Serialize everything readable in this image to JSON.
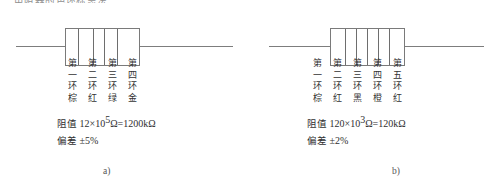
{
  "top_cut_text": "电阻器的色环标志法",
  "figures": [
    {
      "id": "a",
      "caption": "a)",
      "band_count": 4,
      "ordinal_prefix_row": [
        "第",
        "第",
        "第",
        "第"
      ],
      "ordinal_number_row": [
        "一",
        "二",
        "三",
        "四"
      ],
      "ring_row": [
        "环",
        "环",
        "环",
        "环"
      ],
      "color_row": [
        "棕",
        "红",
        "绿",
        "金"
      ],
      "resistance": {
        "label": "阻值",
        "mantissa": "12",
        "times": "×",
        "base": "10",
        "exponent": "5",
        "unit": "Ω",
        "equals": "=",
        "result": "1200kΩ",
        "full": "阻值 12×10⁵Ω=1200kΩ"
      },
      "tolerance": {
        "label": "偏差",
        "value": "±5%",
        "full": "偏差 ±5%"
      }
    },
    {
      "id": "b",
      "caption": "b)",
      "band_count": 5,
      "ordinal_prefix_row": [
        "第",
        "第",
        "第",
        "第",
        "第"
      ],
      "ordinal_number_row": [
        "一",
        "二",
        "三",
        "四",
        "五"
      ],
      "ring_row": [
        "环",
        "环",
        "环",
        "环",
        "环"
      ],
      "color_row": [
        "棕",
        "红",
        "黑",
        "橙",
        "红"
      ],
      "resistance": {
        "label": "阻值",
        "mantissa": "120",
        "times": "×",
        "base": "10",
        "exponent": "3",
        "unit": "Ω",
        "equals": "=",
        "result": "120kΩ",
        "full": "阻值 120×10³Ω=120kΩ"
      },
      "tolerance": {
        "label": "偏差",
        "value": "±2%",
        "full": "偏差 ±2%"
      }
    }
  ],
  "colors": {
    "line": "#7a7a7a",
    "band": "#6e6e6e",
    "text": "#2f2f2f",
    "background": "#ffffff"
  }
}
